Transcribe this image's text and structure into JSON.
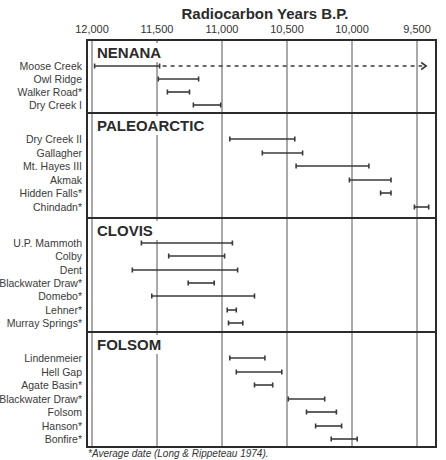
{
  "chart_data": {
    "type": "range-bar (timeline)",
    "title": "Radiocarbon Years B.P.",
    "xlabel": "Radiocarbon Years B.P.",
    "ylabel": "",
    "x_axis": {
      "reversed": true,
      "range": [
        12000,
        9360
      ],
      "ticks": [
        12000,
        11500,
        11000,
        10500,
        10000,
        9500
      ],
      "tick_labels": [
        "12,000",
        "11,500",
        "11,000",
        "10,500",
        "10,000",
        "9,500"
      ],
      "position": "top",
      "grid": true
    },
    "groups": [
      {
        "name": "NENANA",
        "sites": [
          {
            "label": "Moose Creek",
            "start": 11980,
            "end": 11480,
            "dashed_extension_to": 9460,
            "arrow": true
          },
          {
            "label": "Owl Ridge",
            "start": 11490,
            "end": 11180
          },
          {
            "label": "Walker Road*",
            "start": 11420,
            "end": 11250
          },
          {
            "label": "Dry Creek I",
            "start": 11220,
            "end": 11010
          }
        ]
      },
      {
        "name": "PALEOARCTIC",
        "sites": [
          {
            "label": "Dry Creek II",
            "start": 10940,
            "end": 10440
          },
          {
            "label": "Gallagher",
            "start": 10690,
            "end": 10380
          },
          {
            "label": "Mt. Hayes III",
            "start": 10430,
            "end": 9870
          },
          {
            "label": "Akmak",
            "start": 10020,
            "end": 9700
          },
          {
            "label": "Hidden Falls*",
            "start": 9780,
            "end": 9700
          },
          {
            "label": "Chindadn*",
            "start": 9520,
            "end": 9410
          }
        ]
      },
      {
        "name": "CLOVIS",
        "sites": [
          {
            "label": "U.P. Mammoth",
            "start": 11620,
            "end": 10920
          },
          {
            "label": "Colby",
            "start": 11410,
            "end": 10980
          },
          {
            "label": "Dent",
            "start": 11690,
            "end": 10880
          },
          {
            "label": "Blackwater Draw*",
            "start": 11260,
            "end": 11060
          },
          {
            "label": "Domebo*",
            "start": 11540,
            "end": 10750
          },
          {
            "label": "Lehner*",
            "start": 10960,
            "end": 10890
          },
          {
            "label": "Murray Springs*",
            "start": 10950,
            "end": 10840
          }
        ]
      },
      {
        "name": "FOLSOM",
        "sites": [
          {
            "label": "Lindenmeier",
            "start": 10940,
            "end": 10670
          },
          {
            "label": "Hell Gap",
            "start": 10890,
            "end": 10540
          },
          {
            "label": "Agate Basin*",
            "start": 10750,
            "end": 10610
          },
          {
            "label": "Blackwater Draw*",
            "start": 10490,
            "end": 10210
          },
          {
            "label": "Folsom",
            "start": 10350,
            "end": 10120
          },
          {
            "label": "Hanson*",
            "start": 10280,
            "end": 10080
          },
          {
            "label": "Bonfire*",
            "start": 10160,
            "end": 9960
          }
        ]
      }
    ],
    "annotations": [
      "*Average date (Long & Rippeteau 1974)."
    ],
    "legend": null
  },
  "layout": {
    "frame": {
      "left": 87,
      "right": 436,
      "top": 40,
      "bottom": 447
    },
    "x_px_at_12000": 92,
    "px_per_year": 0.13,
    "section_tops": [
      40,
      113,
      218,
      332
    ],
    "row_y": [
      [
        66,
        79,
        92,
        105
      ],
      [
        139,
        153,
        166,
        180,
        193,
        207
      ],
      [
        243,
        256,
        270,
        283,
        296,
        310,
        323
      ],
      [
        358,
        372,
        385,
        399,
        412,
        426,
        439
      ]
    ],
    "label_right_x": 82,
    "colors": {
      "ink": "#2b2b2b",
      "grid": "#555555",
      "bar": "#3a3a3a"
    }
  },
  "footnote": "*Average date (Long & Rippeteau 1974)."
}
